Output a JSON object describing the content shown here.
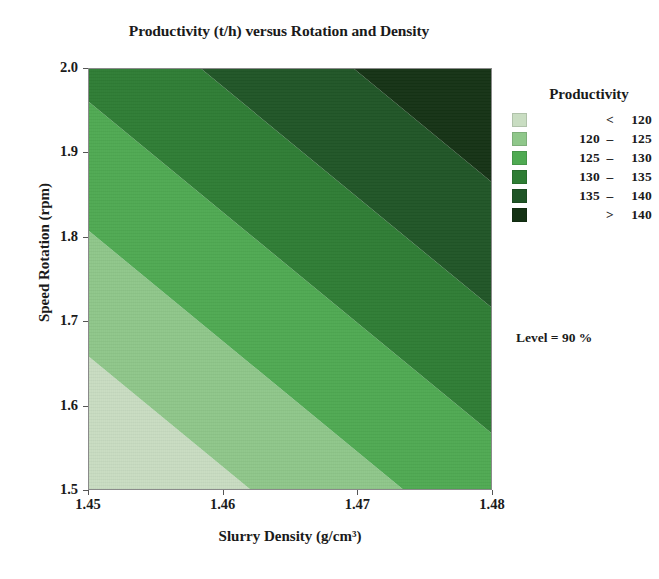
{
  "chart_data": {
    "type": "heatmap",
    "title": "Productivity (t/h) versus Rotation and Density",
    "xlabel": "Slurry Density (g/cm³)",
    "ylabel": "Speed Rotation (rpm)",
    "xlim": [
      1.45,
      1.48
    ],
    "ylim": [
      1.5,
      2.0
    ],
    "xticks": [
      "1.45",
      "1.46",
      "1.47",
      "1.48"
    ],
    "yticks": [
      "2.0",
      "1.9",
      "1.8",
      "1.7",
      "1.6",
      "1.5"
    ],
    "grid": false,
    "legend_position": "right",
    "zlabel": "Productivity",
    "zunit": "t/h",
    "levels": [
      120,
      125,
      130,
      135,
      140
    ],
    "bands": [
      {
        "label_lo": "",
        "label_op": "<",
        "label_hi": "120",
        "color": "#c9ddc2"
      },
      {
        "label_lo": "120",
        "label_op": "–",
        "label_hi": "125",
        "color": "#8fc78a"
      },
      {
        "label_lo": "125",
        "label_op": "–",
        "label_hi": "130",
        "color": "#4faa52"
      },
      {
        "label_lo": "130",
        "label_op": "–",
        "label_hi": "135",
        "color": "#2e7d34"
      },
      {
        "label_lo": "135",
        "label_op": "–",
        "label_hi": "140",
        "color": "#1f5526"
      },
      {
        "label_lo": "",
        "label_op": ">",
        "label_hi": "140",
        "color": "#143214"
      }
    ],
    "annotation": "Level = 90 %",
    "contour_description": "Linear diagonal bands; productivity increases from lower-left (low slurry density, low speed rotation) toward upper-right (high density, high rotation).",
    "corner_values": {
      "bottom_left_1.45_1.5": 118,
      "bottom_right_1.48_1.5": 129,
      "top_left_1.45_2.0": 132,
      "top_right_1.48_2.0": 143
    },
    "band_boundaries_normalized": [
      {
        "level": 120,
        "x_at_bottom": 0.4,
        "x_at_top": -0.87
      },
      {
        "level": 125,
        "x_at_bottom": 0.78,
        "x_at_top": -0.49
      },
      {
        "level": 130,
        "x_at_bottom": 1.17,
        "x_at_top": -0.1
      },
      {
        "level": 135,
        "x_at_bottom": 1.55,
        "x_at_top": 0.28
      },
      {
        "level": 140,
        "x_at_bottom": 1.93,
        "x_at_top": 0.66
      }
    ]
  },
  "legend": {
    "title": "Productivity"
  },
  "annotation": {
    "text": "Level = 90 %"
  }
}
